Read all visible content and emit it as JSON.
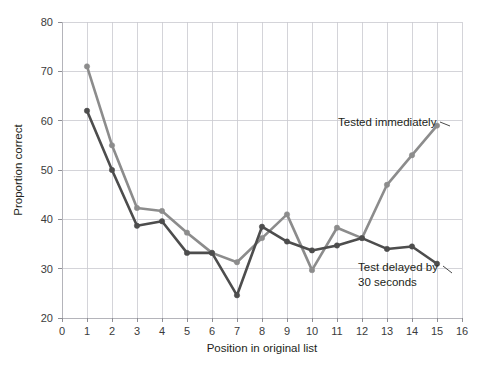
{
  "chart_data": {
    "type": "line",
    "title": "",
    "subtitle": "",
    "xlabel": "Position in original list",
    "ylabel": "Proportion correct",
    "xlim": [
      0,
      16
    ],
    "ylim": [
      20,
      80
    ],
    "xticks": [
      0,
      1,
      2,
      3,
      4,
      5,
      6,
      7,
      8,
      9,
      10,
      11,
      12,
      13,
      14,
      15,
      16
    ],
    "yticks": [
      20,
      30,
      40,
      50,
      60,
      70,
      80
    ],
    "xtick_labels": [
      "0",
      "1",
      "2",
      "3",
      "4",
      "5",
      "6",
      "7",
      "8",
      "9",
      "10",
      "11",
      "12",
      "13",
      "14",
      "15",
      "16"
    ],
    "ytick_labels": [
      "20",
      "30",
      "40",
      "50",
      "60",
      "70",
      "80"
    ],
    "grid": true,
    "legend_position": "inline-annotation",
    "x": [
      1,
      2,
      3,
      4,
      5,
      6,
      7,
      8,
      9,
      10,
      11,
      12,
      13,
      14,
      15
    ],
    "series": [
      {
        "name": "Tested immediately",
        "color": "#8c8c8c",
        "marker": "circle",
        "values": [
          71,
          55,
          42.3,
          41.7,
          37.3,
          33.2,
          31.3,
          36.2,
          41,
          29.7,
          38.3,
          36.2,
          47,
          53,
          59
        ]
      },
      {
        "name": "Test delayed by 30 seconds",
        "color": "#4d4d4d",
        "marker": "circle",
        "values": [
          62,
          50,
          38.7,
          39.6,
          33.2,
          33.2,
          24.6,
          38.5,
          35.5,
          33.7,
          34.7,
          36.2,
          34,
          34.5,
          31
        ]
      }
    ],
    "annotations": [
      {
        "id": "annotation-tested-immediately",
        "text": "Tested immediately",
        "lines": [
          "Tested immediately"
        ],
        "target_series": "Tested immediately"
      },
      {
        "id": "annotation-test-delayed",
        "text": "Test delayed by 30 seconds",
        "lines": [
          "Test delayed by",
          "30 seconds"
        ],
        "target_series": "Test delayed by 30 seconds"
      }
    ],
    "colors": {
      "series_immediate": "#8c8c8c",
      "series_delayed": "#4d4d4d",
      "grid": "#c9c9cf",
      "axis": "#b4b4ba",
      "text": "#231f20",
      "background": "#ffffff"
    }
  }
}
